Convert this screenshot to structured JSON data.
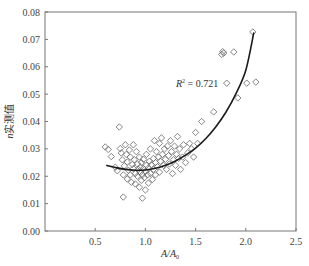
{
  "chart_data": {
    "type": "scatter",
    "title": "",
    "xlabel": "A/A0",
    "xlabel_main": "A/A",
    "xlabel_sub": "0",
    "ylabel": "n实测值",
    "ylabel_italic": "n",
    "ylabel_rest": "实测值",
    "xlim": [
      0.0,
      2.5
    ],
    "ylim": [
      0.0,
      0.08
    ],
    "x_ticks": [
      0.5,
      1.0,
      1.5,
      2.0,
      2.5
    ],
    "x_tick_labels": [
      "0.5",
      "1.0",
      "1.5",
      "2.0",
      "2.5"
    ],
    "y_ticks": [
      0.0,
      0.01,
      0.02,
      0.03,
      0.04,
      0.05,
      0.06,
      0.07,
      0.08
    ],
    "y_tick_labels": [
      "0.00",
      "0.01",
      "0.02",
      "0.03",
      "0.04",
      "0.05",
      "0.06",
      "0.07",
      "0.08"
    ],
    "grid": false,
    "legend": null,
    "marker": "open-diamond",
    "marker_color": "#666666",
    "curve_color": "#1a1a1a",
    "annotation": {
      "text_main": "R",
      "text_sup": "2",
      "text_rest": " = 0.721",
      "x": 1.46,
      "y": 0.0535
    },
    "series": [
      {
        "name": "measured",
        "points": [
          [
            0.6,
            0.0307
          ],
          [
            0.63,
            0.0298
          ],
          [
            0.66,
            0.0272
          ],
          [
            0.7,
            0.0233
          ],
          [
            0.72,
            0.022
          ],
          [
            0.74,
            0.038
          ],
          [
            0.75,
            0.0301
          ],
          [
            0.76,
            0.0285
          ],
          [
            0.77,
            0.026
          ],
          [
            0.78,
            0.0124
          ],
          [
            0.78,
            0.0205
          ],
          [
            0.79,
            0.0238
          ],
          [
            0.8,
            0.0315
          ],
          [
            0.81,
            0.028
          ],
          [
            0.82,
            0.0252
          ],
          [
            0.82,
            0.019
          ],
          [
            0.83,
            0.0222
          ],
          [
            0.84,
            0.0296
          ],
          [
            0.85,
            0.027
          ],
          [
            0.85,
            0.0205
          ],
          [
            0.86,
            0.0178
          ],
          [
            0.87,
            0.0243
          ],
          [
            0.88,
            0.0315
          ],
          [
            0.88,
            0.0228
          ],
          [
            0.89,
            0.026
          ],
          [
            0.9,
            0.021
          ],
          [
            0.9,
            0.0172
          ],
          [
            0.91,
            0.029
          ],
          [
            0.92,
            0.0245
          ],
          [
            0.92,
            0.02
          ],
          [
            0.93,
            0.0225
          ],
          [
            0.94,
            0.016
          ],
          [
            0.94,
            0.027
          ],
          [
            0.95,
            0.0215
          ],
          [
            0.95,
            0.0233
          ],
          [
            0.96,
            0.0185
          ],
          [
            0.96,
            0.025
          ],
          [
            0.97,
            0.012
          ],
          [
            0.97,
            0.0205
          ],
          [
            0.98,
            0.0228
          ],
          [
            0.98,
            0.0262
          ],
          [
            0.99,
            0.0195
          ],
          [
            1.0,
            0.0218
          ],
          [
            1.0,
            0.015
          ],
          [
            1.01,
            0.024
          ],
          [
            1.01,
            0.028
          ],
          [
            1.02,
            0.0205
          ],
          [
            1.03,
            0.023
          ],
          [
            1.03,
            0.0175
          ],
          [
            1.04,
            0.0255
          ],
          [
            1.05,
            0.021
          ],
          [
            1.05,
            0.03
          ],
          [
            1.06,
            0.0242
          ],
          [
            1.07,
            0.0188
          ],
          [
            1.08,
            0.0265
          ],
          [
            1.08,
            0.0225
          ],
          [
            1.09,
            0.033
          ],
          [
            1.1,
            0.025
          ],
          [
            1.1,
            0.0205
          ],
          [
            1.11,
            0.029
          ],
          [
            1.12,
            0.0235
          ],
          [
            1.13,
            0.027
          ],
          [
            1.14,
            0.032
          ],
          [
            1.14,
            0.0215
          ],
          [
            1.15,
            0.0255
          ],
          [
            1.16,
            0.034
          ],
          [
            1.17,
            0.028
          ],
          [
            1.18,
            0.024
          ],
          [
            1.19,
            0.03
          ],
          [
            1.2,
            0.0262
          ],
          [
            1.21,
            0.0225
          ],
          [
            1.22,
            0.031
          ],
          [
            1.23,
            0.0275
          ],
          [
            1.24,
            0.0245
          ],
          [
            1.25,
            0.033
          ],
          [
            1.26,
            0.029
          ],
          [
            1.27,
            0.021
          ],
          [
            1.28,
            0.026
          ],
          [
            1.29,
            0.031
          ],
          [
            1.3,
            0.024
          ],
          [
            1.31,
            0.028
          ],
          [
            1.32,
            0.0345
          ],
          [
            1.33,
            0.0265
          ],
          [
            1.34,
            0.03
          ],
          [
            1.35,
            0.0225
          ],
          [
            1.37,
            0.027
          ],
          [
            1.38,
            0.0315
          ],
          [
            1.4,
            0.025
          ],
          [
            1.42,
            0.0285
          ],
          [
            1.44,
            0.032
          ],
          [
            1.46,
            0.03
          ],
          [
            1.48,
            0.027
          ],
          [
            1.5,
            0.036
          ],
          [
            1.52,
            0.032
          ],
          [
            1.56,
            0.04
          ],
          [
            1.68,
            0.0435
          ],
          [
            1.76,
            0.0645
          ],
          [
            1.77,
            0.0655
          ],
          [
            1.78,
            0.065
          ],
          [
            1.81,
            0.054
          ],
          [
            1.88,
            0.0654
          ],
          [
            1.92,
            0.0486
          ],
          [
            2.01,
            0.054
          ],
          [
            2.07,
            0.0727
          ],
          [
            2.1,
            0.0544
          ]
        ]
      }
    ],
    "fit_curve": {
      "name": "trend",
      "x_range": [
        0.61,
        2.08
      ],
      "points": [
        [
          0.61,
          0.024
        ],
        [
          0.7,
          0.0232
        ],
        [
          0.8,
          0.0225
        ],
        [
          0.9,
          0.0222
        ],
        [
          1.0,
          0.0223
        ],
        [
          1.1,
          0.0229
        ],
        [
          1.2,
          0.024
        ],
        [
          1.3,
          0.0256
        ],
        [
          1.4,
          0.0277
        ],
        [
          1.5,
          0.0303
        ],
        [
          1.6,
          0.0337
        ],
        [
          1.7,
          0.038
        ],
        [
          1.8,
          0.0433
        ],
        [
          1.9,
          0.05
        ],
        [
          2.0,
          0.0587
        ],
        [
          2.08,
          0.0725
        ]
      ]
    },
    "r_squared": 0.721
  }
}
